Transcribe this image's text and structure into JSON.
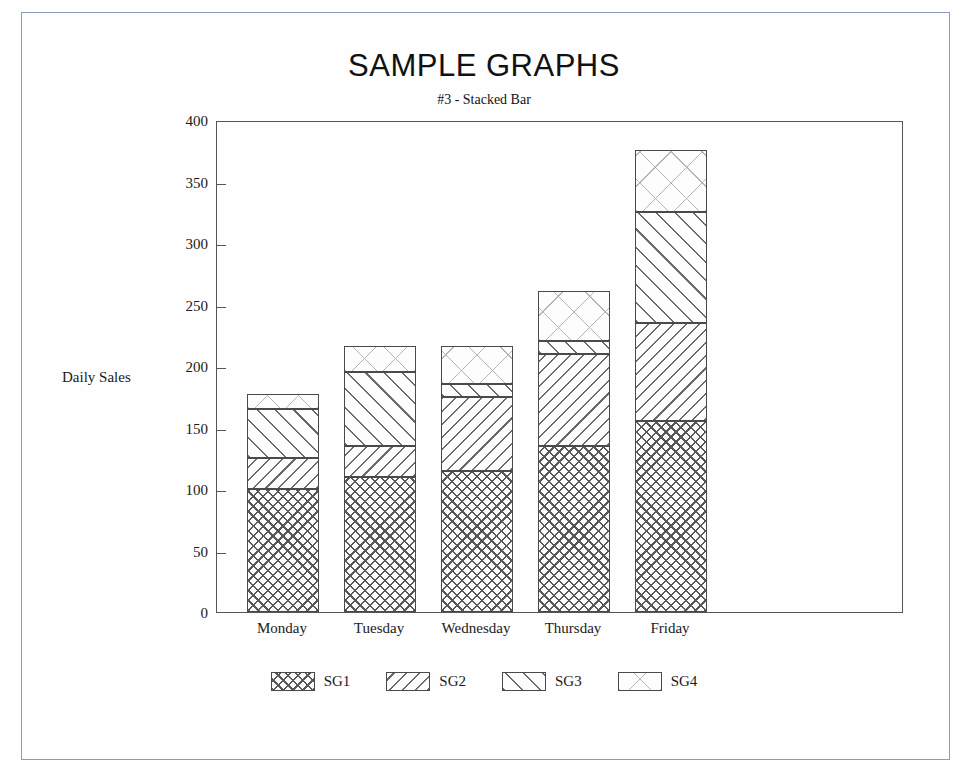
{
  "page": {
    "border_color": "#8d9ac4"
  },
  "chart_data": {
    "type": "bar",
    "subtype": "stacked-bar",
    "title": "SAMPLE GRAPHS",
    "subtitle": "#3 - Stacked Bar",
    "xlabel": "",
    "ylabel": "Daily Sales",
    "categories": [
      "Monday",
      "Tuesday",
      "Wednesday",
      "Thursday",
      "Friday"
    ],
    "series": [
      {
        "name": "SG1",
        "pattern": "cross-hatch-dense",
        "values": [
          100,
          110,
          115,
          135,
          155
        ]
      },
      {
        "name": "SG2",
        "pattern": "diagonal-backward-dense",
        "values": [
          25,
          25,
          60,
          75,
          80
        ]
      },
      {
        "name": "SG3",
        "pattern": "diagonal-forward-medium",
        "values": [
          40,
          60,
          10,
          10,
          90
        ]
      },
      {
        "name": "SG4",
        "pattern": "cross-hatch-sparse",
        "values": [
          12,
          21,
          31,
          41,
          51
        ]
      }
    ],
    "totals": [
      177,
      216,
      216,
      261,
      376
    ],
    "ylim": [
      0,
      400
    ],
    "yticks": [
      0,
      50,
      100,
      150,
      200,
      250,
      300,
      350,
      400
    ],
    "ytick_labels": [
      "0",
      "50",
      "100",
      "150",
      "200",
      "250",
      "300",
      "350",
      "400"
    ],
    "grid": false,
    "legend_position": "bottom",
    "legend_entries": [
      "SG1",
      "SG2",
      "SG3",
      "SG4"
    ]
  }
}
